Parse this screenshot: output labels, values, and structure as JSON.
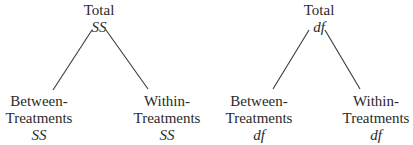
{
  "diagram": {
    "trees": [
      {
        "root": {
          "label": "Total",
          "symbol": "SS"
        },
        "left": {
          "line1": "Between-",
          "line2": "Treatments",
          "symbol": "SS"
        },
        "right": {
          "line1": "Within-",
          "line2": "Treatments",
          "symbol": "SS"
        }
      },
      {
        "root": {
          "label": "Total",
          "symbol": "df"
        },
        "left": {
          "line1": "Between-",
          "line2": "Treatments",
          "symbol": "df"
        },
        "right": {
          "line1": "Within-",
          "line2": "Treatments",
          "symbol": "df"
        }
      }
    ],
    "line_color": "#3a3a3a"
  }
}
